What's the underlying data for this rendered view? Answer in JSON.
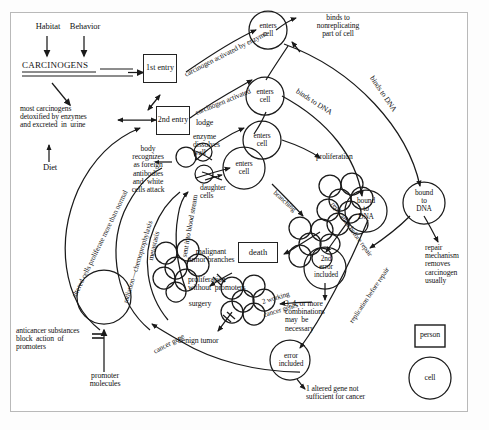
{
  "figure": {
    "stroke_color": "#1a1a1a",
    "frame_color": "#b9b9b9",
    "background": "#ffffff"
  },
  "inputs": {
    "habitat": "Habitat",
    "behavior": "Behavior",
    "carcinogens": "CARCINOGENS",
    "diet": "Diet",
    "detox": "most carcinogens\ndetoxified by enzymes\nand excreted  in  urine"
  },
  "entry_boxes": {
    "first": "1st\nentry",
    "second": "2nd\nentry"
  },
  "arc_labels": {
    "carcinogen_activated_by_enzyme": "carcinogen activated by enzyme",
    "carcinogen_activated": "carcinogen activated",
    "binds_to_dna_outer": "binds to DNA",
    "binds_to_dna_inner": "binds to DNA",
    "altered_cells": "altered cells proliferate more than normal",
    "radiation": "radiation—chemoprophylaxis",
    "metastasis": "metastasis",
    "blood_stream": "sent into blood stream",
    "cancer_gene": "cancer gene",
    "branching": "branching",
    "replication_before_repair_1": "replication before repair",
    "replication_before_repair_2": "replication before repair",
    "two_working": "2 working",
    "cancer_genes": "cancer genes"
  },
  "cells": {
    "enters_cell_1": "enters\ncell",
    "enters_cell_2": "enters\ncell",
    "enters_cell_3": "enters\ncell",
    "enters_cell_4": "enters\ncell",
    "bound_to_dna_1": "bound\nto\nDNA",
    "bound_to_dna_2": "bound\nto\nDNA",
    "second_error": "2nd\nerror\nincluded",
    "error_included": "error\nincluded"
  },
  "statements": {
    "binds_nonreplicating": "binds to\nnonreplicating\npart of cell",
    "lodge": "lodge",
    "enzyme_dissolves_wall": "enzyme\ndissolves\nwall",
    "daughter_cells": "daughter\ncells",
    "body_recognizes": "body\nrecognizes\nas foreign\nantibodies\nand  white\ncells attack",
    "proliferation": "proliferation",
    "repair_mechanism": "repair\nmechanism\nremoves\ncarcinogen\nusually",
    "death": "death",
    "malignant_tumor": "malignant\ntumor branches",
    "proliferation_without_promoters": "proliferation\nwithout  promoters",
    "surgery": "surgery",
    "benign_tumor": "benign tumor",
    "combinations": "3, 4, or more\ncombinations\nmay  be\nnecessary",
    "one_altered_gene": "1 altered gene not\nsufficient for cancer",
    "anticancer": "anticancer substances\nblock  action  of\npromoters",
    "promoter_molecules": "promoter\nmolecules"
  },
  "legend": {
    "person": "person",
    "cell": "cell"
  }
}
